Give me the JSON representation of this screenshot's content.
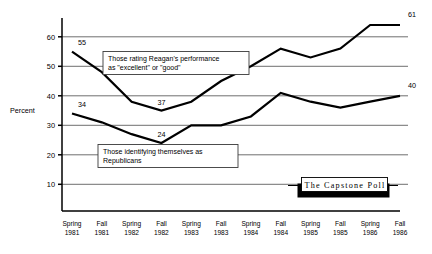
{
  "chart_data": {
    "type": "line",
    "title": "",
    "subtitle": "",
    "xlabel": "",
    "ylabel": "Percent",
    "ylim": [
      0,
      68
    ],
    "yticks": [
      10,
      20,
      30,
      40,
      50,
      60
    ],
    "grid": true,
    "legend_position": "inline-annotation",
    "categories": [
      "Spring 1981",
      "Fall 1981",
      "Spring 1982",
      "Fall 1982",
      "Spring 1983",
      "Fall 1983",
      "Spring 1984",
      "Fall 1984",
      "Spring 1985",
      "Fall 1985",
      "Spring 1986",
      "Fall 1986"
    ],
    "category_lines": [
      [
        "Spring",
        "1981"
      ],
      [
        "Fall",
        "1981"
      ],
      [
        "Spring",
        "1982"
      ],
      [
        "Fall",
        "1982"
      ],
      [
        "Spring",
        "1983"
      ],
      [
        "Fall",
        "1983"
      ],
      [
        "Spring",
        "1984"
      ],
      [
        "Fall",
        "1984"
      ],
      [
        "Spring",
        "1985"
      ],
      [
        "Fall",
        "1985"
      ],
      [
        "Spring",
        "1986"
      ],
      [
        "Fall",
        "1986"
      ]
    ],
    "series": [
      {
        "name": "Those rating Reagan's performance as \"excellent\" or \"good\"",
        "values": [
          55,
          48,
          38,
          35,
          38,
          45,
          50,
          56,
          53,
          56,
          64,
          64
        ],
        "point_labels": {
          "0": "55",
          "3": "37",
          "11": "61"
        }
      },
      {
        "name": "Those identifying themselves as Republicans",
        "values": [
          34,
          31,
          27,
          24,
          30,
          30,
          33,
          41,
          38,
          36,
          38,
          40
        ],
        "point_labels": {
          "0": "34",
          "3": "24",
          "11": "40"
        }
      }
    ],
    "annotations": [
      {
        "id": "reagan-approval-callout",
        "lines": [
          "Those rating Reagan's performance",
          "as \"excellent\" or \"good\""
        ]
      },
      {
        "id": "republican-id-callout",
        "lines": [
          "Those identifying themselves as",
          "Republicans"
        ]
      }
    ],
    "data_labels": [
      "55",
      "37",
      "61",
      "34",
      "24",
      "40"
    ],
    "ytick_labels": [
      "60",
      "50",
      "40",
      "30",
      "20",
      "10"
    ]
  },
  "logo": {
    "text": "The Capstone Poll"
  },
  "colors": {
    "line": "#000000",
    "grid": "#4a4a4a",
    "background": "#ffffff",
    "logo_shadow": "#000000"
  }
}
